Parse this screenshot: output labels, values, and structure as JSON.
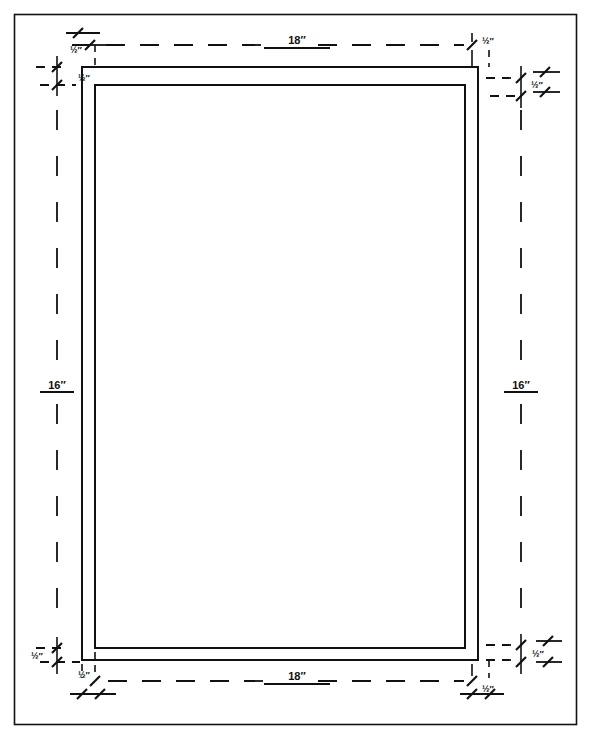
{
  "figure": {
    "units": "inches",
    "caption": ""
  },
  "dimensions": {
    "width_label": "18″",
    "height_label": "16″",
    "margin_label": "½″"
  },
  "labels": {
    "top_width": "18″",
    "bottom_width": "18″",
    "left_height": "16″",
    "right_height": "16″",
    "top_left_outer_margin": "½″",
    "top_left_inner_margin": "½″",
    "top_right_margin": "½″",
    "right_top_margin": "½″",
    "bottom_left_vertical_margin": "½″",
    "bottom_left_horizontal_margin": "½″",
    "bottom_right_margin": "½″",
    "right_bottom_margin": "½″"
  },
  "geometry": {
    "outer_border": {
      "x": 14,
      "y": 14,
      "w": 563,
      "h": 711
    },
    "mat_outer_rect": {
      "x": 82,
      "y": 67,
      "w": 396,
      "h": 593
    },
    "mat_inner_rect": {
      "x": 95,
      "y": 85,
      "w": 370,
      "h": 563
    },
    "top_dim_line_y": 45,
    "bottom_dim_line_y": 681,
    "left_dim_line_x": 57,
    "right_dim_line_x": 521
  },
  "style": {
    "ink": "#111111",
    "paper": "#ffffff",
    "line_weight": 1.6,
    "dash_pattern": "20 14"
  }
}
